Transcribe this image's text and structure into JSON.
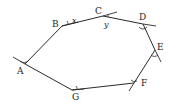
{
  "diagram": {
    "title": "",
    "type": "polygon-exterior-angles",
    "vertices": [
      {
        "label": "A",
        "x": 25,
        "y": 64
      },
      {
        "label": "B",
        "x": 62,
        "y": 26
      },
      {
        "label": "C",
        "x": 103,
        "y": 16
      },
      {
        "label": "D",
        "x": 143,
        "y": 24
      },
      {
        "label": "E",
        "x": 155,
        "y": 50
      },
      {
        "label": "F",
        "x": 134,
        "y": 83
      },
      {
        "label": "G",
        "x": 72,
        "y": 90
      }
    ],
    "angle_labels": [
      {
        "text": "x",
        "vertex": "B"
      },
      {
        "text": "y",
        "vertex": "C"
      }
    ],
    "labels": {
      "A": "A",
      "B": "B",
      "C": "C",
      "D": "D",
      "E": "E",
      "F": "F",
      "G": "G",
      "x": "x",
      "y": "y"
    },
    "colors": {
      "stroke": "#2a2a2a",
      "background": "#ffffff"
    }
  }
}
